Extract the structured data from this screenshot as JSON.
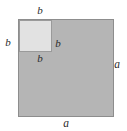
{
  "figure": {
    "type": "geometric-diagram",
    "canvas": {
      "width": 127,
      "height": 131,
      "background_color": "#ffffff"
    },
    "outer_square": {
      "name": "outer-square",
      "side_label": "a",
      "fill_color": "#b5b5b5",
      "border_color": "#8d8d8d",
      "x": 18,
      "y": 19,
      "width": 96,
      "height": 98
    },
    "inner_square": {
      "name": "inner-square",
      "side_label": "b",
      "fill_color": "#e2e2e2",
      "border_color": "#9a9a9a",
      "x": 19,
      "y": 20,
      "width": 33,
      "height": 32
    },
    "labels": [
      {
        "id": "b-top",
        "text": "b",
        "x": 40,
        "y": 10
      },
      {
        "id": "b-left",
        "text": "b",
        "x": 8,
        "y": 42
      },
      {
        "id": "b-inner-right",
        "text": "b",
        "x": 58,
        "y": 43
      },
      {
        "id": "b-inner-bottom",
        "text": "b",
        "x": 40,
        "y": 58
      },
      {
        "id": "a-right",
        "text": "a",
        "x": 117,
        "y": 65
      },
      {
        "id": "a-bottom",
        "text": "a",
        "x": 66,
        "y": 124
      }
    ]
  }
}
